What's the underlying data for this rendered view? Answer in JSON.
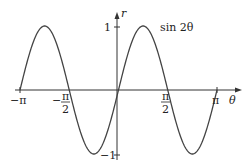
{
  "chart_data": {
    "type": "line",
    "title": "",
    "series": [
      {
        "name": "sin 2θ",
        "function": "sin(2θ)"
      }
    ],
    "x": [
      -3.1416,
      -2.3562,
      -1.5708,
      -0.7854,
      0,
      0.7854,
      1.5708,
      2.3562,
      3.1416
    ],
    "values": [
      0,
      1,
      0,
      -1,
      0,
      1,
      0,
      -1,
      0
    ],
    "xlabel": "θ",
    "ylabel": "r",
    "xlim": [
      -3.1416,
      3.1416
    ],
    "ylim": [
      -1,
      1
    ],
    "x_tick_labels": [
      "−π",
      "−π/2",
      "π/2",
      "π"
    ],
    "y_tick_labels": [
      "1",
      "−1"
    ],
    "annotations": [
      "sin 2θ"
    ],
    "grid": false,
    "legend": "none"
  },
  "labels": {
    "curve": "sin 2θ",
    "xaxis": "θ",
    "yaxis": "r",
    "neg_pi": "−π",
    "pi": "π",
    "one": "1",
    "neg_one": "−1",
    "pi_sym": "π",
    "two": "2",
    "minus": "−"
  }
}
